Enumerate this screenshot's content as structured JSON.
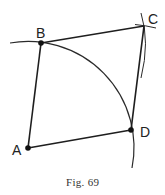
{
  "figure": {
    "caption": "Fig. 69",
    "stroke_color": "#2a2a2a",
    "background": "#ffffff"
  },
  "points": {
    "A": {
      "label": "A",
      "x": 28,
      "y": 148
    },
    "B": {
      "label": "B",
      "x": 41,
      "y": 43
    },
    "C": {
      "label": "C",
      "x": 144,
      "y": 26
    },
    "D": {
      "label": "D",
      "x": 131,
      "y": 130
    }
  },
  "segments": [
    {
      "from": "A",
      "to": "B"
    },
    {
      "from": "B",
      "to": "C"
    },
    {
      "from": "C",
      "to": "D"
    },
    {
      "from": "D",
      "to": "A"
    }
  ],
  "arcs": [
    {
      "name": "main-arc-centered-at-A",
      "center": "A",
      "through": [
        "B",
        "D"
      ]
    },
    {
      "name": "arc-near-C-from-B",
      "center": "B"
    },
    {
      "name": "arc-near-C-from-D",
      "center": "D"
    }
  ]
}
